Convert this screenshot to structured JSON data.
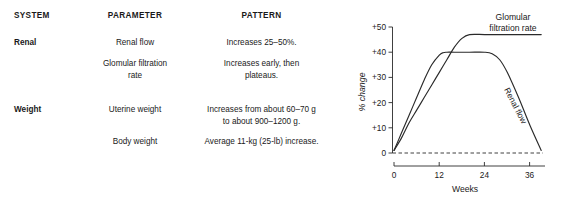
{
  "table": {
    "headers": {
      "system": "SYSTEM",
      "parameter": "PARAMETER",
      "pattern": "PATTERN"
    },
    "rows": [
      {
        "system": "Renal",
        "parameter_lines": [
          "Renal flow"
        ],
        "pattern_lines": [
          "Increases 25–50%."
        ]
      },
      {
        "system": "",
        "parameter_lines": [
          "Glomular filtration",
          "rate"
        ],
        "pattern_lines": [
          "Increases early, then",
          "plateaus."
        ]
      },
      {
        "system": "Weight",
        "parameter_lines": [
          "Uterine weight"
        ],
        "pattern_lines": [
          "Increases from about 60–70 g",
          "to about 900–1200 g."
        ]
      },
      {
        "system": "",
        "parameter_lines": [
          "Body weight"
        ],
        "pattern_lines": [
          "Average 11-kg (25-lb) increase."
        ]
      }
    ]
  },
  "chart_data": {
    "type": "line",
    "title": "",
    "xlabel": "Weeks",
    "ylabel": "% change",
    "xlim": [
      0,
      40
    ],
    "ylim": [
      0,
      52
    ],
    "xticks": [
      0,
      12,
      24,
      36
    ],
    "xtick_labels": [
      "0",
      "12",
      "24",
      "36"
    ],
    "yticks": [
      0,
      10,
      20,
      30,
      40,
      50
    ],
    "ytick_labels": [
      "0",
      "+10",
      "+20",
      "+30",
      "+40",
      "+50"
    ],
    "grid": false,
    "legend_position": "inline-annotation",
    "zero_reference_line": {
      "value": 0,
      "style": "dashed"
    },
    "series": [
      {
        "name": "Glomular filtration rate",
        "label_lines": [
          "Glomular",
          "filtration rate"
        ],
        "label_position": "top-right",
        "x": [
          0,
          2,
          4,
          6,
          8,
          10,
          12,
          14,
          16,
          18,
          20,
          24,
          28,
          32,
          36,
          39
        ],
        "y": [
          1,
          6,
          12,
          17,
          22,
          27,
          32,
          37,
          42,
          45.5,
          47,
          47,
          47,
          47,
          47,
          47
        ]
      },
      {
        "name": "Renal flow",
        "label_lines": [
          "Renal flow"
        ],
        "label_position": "descending-limb",
        "x": [
          0,
          2,
          4,
          6,
          8,
          10,
          12,
          13,
          14,
          16,
          20,
          24,
          26,
          28,
          30,
          33,
          36,
          39
        ],
        "y": [
          1,
          8,
          15,
          22,
          29,
          35,
          38.8,
          39.8,
          40,
          40,
          40,
          40,
          39.4,
          37,
          32,
          22,
          11,
          1
        ]
      }
    ]
  }
}
